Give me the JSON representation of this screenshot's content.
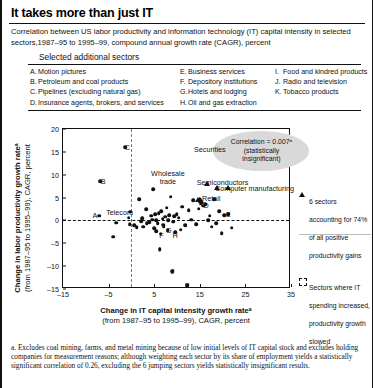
{
  "header": {
    "title": "It takes more than just IT",
    "subtitle": "Correlation between US labor productivity and information technology (IT) capital intensity in selected sectors,1987–95 to 1995–99, compound annual growth rate (CAGR), percent"
  },
  "sectors_box": {
    "heading": "Selected additional sectors",
    "column1": [
      {
        "key": "A.",
        "label": "Motion pictures"
      },
      {
        "key": "B.",
        "label": "Petroleum and coal products"
      },
      {
        "key": "C.",
        "label": "Pipelines (excluding natural gas)"
      },
      {
        "key": "D.",
        "label": "Insurance agents, brokers, and services"
      }
    ],
    "column2": [
      {
        "key": "E.",
        "label": "Business services"
      },
      {
        "key": "F.",
        "label": "Depository institutions"
      },
      {
        "key": "G.",
        "label": "Hotels and lodging"
      },
      {
        "key": "H.",
        "label": "Oil and gas extraction"
      }
    ],
    "column3": [
      {
        "key": "I.",
        "label": "Food and kindred products"
      },
      {
        "key": "J.",
        "label": "Radio and television"
      },
      {
        "key": "K.",
        "label": "Tobacco products"
      }
    ]
  },
  "chart_data": {
    "type": "scatter",
    "title": "",
    "xlabel_bold": "Change in IT capital intensity growth rateᵃ",
    "xlabel_rest": "(from 1987–95 to 1995–99), CAGR, percent",
    "ylabel_bold": "Change in labor productivity growth rateᵃ",
    "ylabel_rest": "(from 1987–95 to 1995–99), CAGR, percent",
    "xlim": [
      -15,
      35
    ],
    "ylim": [
      -15,
      20
    ],
    "xticks": [
      -15,
      -5,
      5,
      15,
      25,
      35
    ],
    "yticks": [
      -15,
      -10,
      -5,
      0,
      5,
      10,
      15,
      20
    ],
    "grid": false,
    "zero_line_y": 0,
    "shaded_band_x": 0,
    "annotation_bubble": {
      "line1": "Correlation = 0.007ᵃ",
      "line2": "(statistically",
      "line3": "insignificant)"
    },
    "point_labels": [
      {
        "text": "Securities",
        "x": 17.2,
        "y": 15.6
      },
      {
        "text": "Semiconductors",
        "x": 20.0,
        "y": 8.4
      },
      {
        "text": "Computer manufacturing",
        "x": 27.0,
        "y": 7.2
      },
      {
        "text": "Wholesale trade",
        "x": 8.0,
        "y": 9.3
      },
      {
        "text": "Retail",
        "x": 17.5,
        "y": 4.8
      },
      {
        "text": "Telecom",
        "x": -2.6,
        "y": 1.9
      }
    ],
    "letter_labels": [
      {
        "key": "A",
        "x": -8.0,
        "y": 1.1
      },
      {
        "key": "B",
        "x": -6.2,
        "y": 8.6
      },
      {
        "key": "C",
        "x": -0.9,
        "y": 16.1
      },
      {
        "key": "D",
        "x": 16.4,
        "y": 3.4
      },
      {
        "key": "E",
        "x": 21.3,
        "y": 1.3
      },
      {
        "key": "F",
        "x": 6.6,
        "y": -3.2
      },
      {
        "key": "G",
        "x": 8.2,
        "y": -2.1
      },
      {
        "key": "H",
        "x": 9.6,
        "y": -3.2
      },
      {
        "key": "I",
        "x": 6.2,
        "y": -6.2
      },
      {
        "key": "J",
        "x": 9.0,
        "y": -11.1
      },
      {
        "key": "K",
        "x": 12.3,
        "y": -14.1
      }
    ],
    "series": [
      {
        "name": "Other sectors",
        "marker": "circle",
        "points": [
          [
            -7.1,
            1.0
          ],
          [
            -6.9,
            8.6
          ],
          [
            -4.0,
            -3.6
          ],
          [
            -3.3,
            -0.5
          ],
          [
            -1.4,
            16.0
          ],
          [
            -0.6,
            0.6
          ],
          [
            -0.4,
            -0.8
          ],
          [
            -0.2,
            1.9
          ],
          [
            0.6,
            -1.0
          ],
          [
            1.2,
            -1.5
          ],
          [
            1.7,
            4.7
          ],
          [
            2.1,
            -0.2
          ],
          [
            2.4,
            0.5
          ],
          [
            2.6,
            -1.4
          ],
          [
            3.2,
            2.4
          ],
          [
            3.4,
            -0.6
          ],
          [
            3.9,
            -0.4
          ],
          [
            4.3,
            1.0
          ],
          [
            4.6,
            0.2
          ],
          [
            4.8,
            6.8
          ],
          [
            5.0,
            -1.7
          ],
          [
            5.2,
            1.3
          ],
          [
            5.4,
            0.0
          ],
          [
            5.5,
            -2.4
          ],
          [
            5.8,
            -0.6
          ],
          [
            6.0,
            1.6
          ],
          [
            6.2,
            -6.3
          ],
          [
            6.4,
            -2.9
          ],
          [
            6.6,
            2.0
          ],
          [
            6.9,
            0.4
          ],
          [
            7.1,
            -1.2
          ],
          [
            7.4,
            0.8
          ],
          [
            7.7,
            2.8
          ],
          [
            8.0,
            -2.2
          ],
          [
            8.3,
            1.2
          ],
          [
            8.6,
            5.2
          ],
          [
            8.9,
            -11.1
          ],
          [
            9.2,
            -0.3
          ],
          [
            9.6,
            -2.6
          ],
          [
            9.9,
            1.4
          ],
          [
            10.4,
            0.6
          ],
          [
            10.8,
            -2.0
          ],
          [
            11.2,
            3.0
          ],
          [
            11.8,
            -1.0
          ],
          [
            12.3,
            -14.2
          ],
          [
            12.6,
            2.2
          ],
          [
            13.1,
            0.2
          ],
          [
            13.5,
            4.4
          ],
          [
            14.2,
            -0.8
          ],
          [
            14.8,
            2.6
          ],
          [
            15.4,
            4.0
          ],
          [
            15.8,
            3.2
          ],
          [
            16.2,
            3.5
          ],
          [
            16.8,
            0.0
          ],
          [
            17.2,
            1.0
          ],
          [
            17.6,
            -1.4
          ],
          [
            18.2,
            4.6
          ],
          [
            18.6,
            -0.6
          ],
          [
            19.2,
            2.0
          ],
          [
            19.8,
            -2.8
          ],
          [
            20.4,
            1.2
          ],
          [
            21.2,
            1.3
          ],
          [
            22.0,
            -1.6
          ],
          [
            15.0,
            4.7
          ],
          [
            15.2,
            3.8
          ],
          [
            9.4,
            0.9
          ],
          [
            7.0,
            -0.9
          ],
          [
            8.1,
            0.1
          ]
        ]
      },
      {
        "name": "6 sectors accounting for 74% of all positive productivity gains",
        "marker": "triangle",
        "points": [
          [
            19.6,
            15.6
          ],
          [
            18.8,
            7.0
          ],
          [
            21.2,
            7.0
          ],
          [
            15.2,
            4.2
          ],
          [
            16.6,
            8.0
          ],
          [
            14.6,
            4.4
          ]
        ]
      }
    ],
    "legend": [
      {
        "marker": "triangle",
        "text": "6 sectors accounting for 74% of all positive productivity gains"
      },
      {
        "marker": "dashed-box",
        "text": "Sectors where IT spending increased, productivity growth slowed"
      }
    ]
  },
  "footnote": {
    "note_a": "a. Excludes coal mining, farms, and metal mining because of low initial levels of IT capital stock and excludes holding companies for measurement reasons; although weighting each sector by its share of employment yields a statistically significant correlation of 0.26, excluding the 6 jumping sectors yields statistically insignificant results."
  }
}
